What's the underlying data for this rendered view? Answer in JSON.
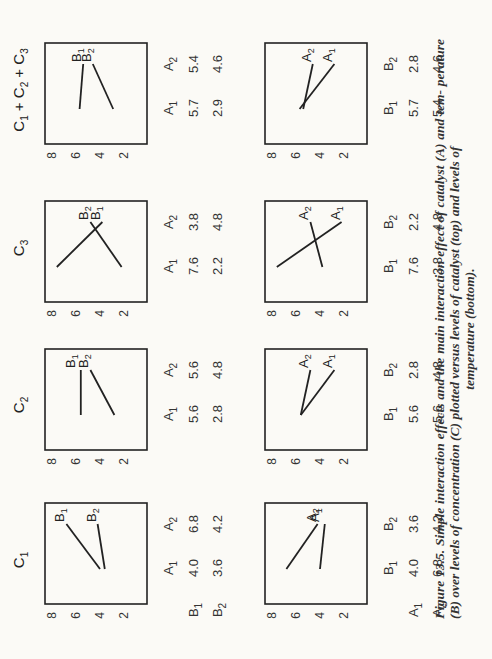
{
  "figure": {
    "caption_lines": [
      "Figure 13.5. Simple interaction effects and the main interaction effect of catalyst (A) and tem-",
      "perature (B) over levels of concentration (C) plotted versus levels of catalyst (top) and levels of",
      "temperature (bottom)."
    ],
    "orientation": "rotated 90° counter-clockwise"
  },
  "chart_data": [
    {
      "type": "line",
      "row": "top",
      "title": "C1",
      "xlabel": "",
      "ylabel": "",
      "ylim": [
        2,
        8
      ],
      "yticks": [
        8,
        6,
        4,
        2
      ],
      "categories": [
        "A1",
        "A2"
      ],
      "series": [
        {
          "name": "B1",
          "values": [
            4.0,
            6.8
          ]
        },
        {
          "name": "B2",
          "values": [
            3.6,
            4.2
          ]
        }
      ]
    },
    {
      "type": "line",
      "row": "top",
      "title": "C2",
      "ylim": [
        2,
        8
      ],
      "yticks": [
        8,
        6,
        4,
        2
      ],
      "categories": [
        "A1",
        "A2"
      ],
      "series": [
        {
          "name": "B1",
          "values": [
            5.6,
            5.6
          ]
        },
        {
          "name": "B2",
          "values": [
            2.8,
            4.8
          ]
        }
      ]
    },
    {
      "type": "line",
      "row": "top",
      "title": "C3",
      "ylim": [
        2,
        8
      ],
      "yticks": [
        8,
        6,
        4,
        2
      ],
      "categories": [
        "A1",
        "A2"
      ],
      "series": [
        {
          "name": "B1",
          "values": [
            7.6,
            3.8
          ]
        },
        {
          "name": "B2",
          "values": [
            2.2,
            4.8
          ]
        }
      ]
    },
    {
      "type": "line",
      "row": "top",
      "title": "C1 + C2 + C3",
      "ylim": [
        2,
        8
      ],
      "yticks": [
        8,
        6,
        4,
        2
      ],
      "categories": [
        "A1",
        "A2"
      ],
      "series": [
        {
          "name": "B1",
          "values": [
            5.7,
            5.4
          ]
        },
        {
          "name": "B2",
          "values": [
            2.9,
            4.6
          ]
        }
      ]
    },
    {
      "type": "line",
      "row": "bottom",
      "title": "C1",
      "ylim": [
        2,
        8
      ],
      "yticks": [
        8,
        6,
        4,
        2
      ],
      "categories": [
        "B1",
        "B2"
      ],
      "series": [
        {
          "name": "A1",
          "values": [
            4.0,
            3.6
          ]
        },
        {
          "name": "A2",
          "values": [
            6.8,
            4.2
          ]
        }
      ]
    },
    {
      "type": "line",
      "row": "bottom",
      "title": "C2",
      "ylim": [
        2,
        8
      ],
      "yticks": [
        8,
        6,
        4,
        2
      ],
      "categories": [
        "B1",
        "B2"
      ],
      "series": [
        {
          "name": "A1",
          "values": [
            5.6,
            2.8
          ]
        },
        {
          "name": "A2",
          "values": [
            5.6,
            4.8
          ]
        }
      ]
    },
    {
      "type": "line",
      "row": "bottom",
      "title": "C3",
      "ylim": [
        2,
        8
      ],
      "yticks": [
        8,
        6,
        4,
        2
      ],
      "categories": [
        "B1",
        "B2"
      ],
      "series": [
        {
          "name": "A1",
          "values": [
            7.6,
            2.2
          ]
        },
        {
          "name": "A2",
          "values": [
            3.8,
            4.8
          ]
        }
      ]
    },
    {
      "type": "line",
      "row": "bottom",
      "title": "C1 + C2 + C3",
      "ylim": [
        2,
        8
      ],
      "yticks": [
        8,
        6,
        4,
        2
      ],
      "categories": [
        "B1",
        "B2"
      ],
      "series": [
        {
          "name": "A1",
          "values": [
            5.7,
            2.8
          ]
        },
        {
          "name": "A2",
          "values": [
            5.4,
            4.6
          ]
        }
      ]
    }
  ],
  "top_row": {
    "column_titles": [
      "C1",
      "C2",
      "C3",
      "C1 + C2 + C3"
    ],
    "tables": [
      {
        "col_headers": [
          "A1",
          "A2"
        ],
        "rows": [
          {
            "label": "B1",
            "values": [
              "4.0",
              "6.8"
            ]
          },
          {
            "label": "B2",
            "values": [
              "3.6",
              "4.2"
            ]
          }
        ]
      },
      {
        "col_headers": [
          "A1",
          "A2"
        ],
        "rows": [
          {
            "label": "",
            "values": [
              "5.6",
              "5.6"
            ]
          },
          {
            "label": "",
            "values": [
              "2.8",
              "4.8"
            ]
          }
        ]
      },
      {
        "col_headers": [
          "A1",
          "A2"
        ],
        "rows": [
          {
            "label": "",
            "values": [
              "7.6",
              "3.8"
            ]
          },
          {
            "label": "",
            "values": [
              "2.2",
              "4.8"
            ]
          }
        ]
      },
      {
        "col_headers": [
          "A1",
          "A2"
        ],
        "rows": [
          {
            "label": "",
            "values": [
              "5.7",
              "5.4"
            ]
          },
          {
            "label": "",
            "values": [
              "2.9",
              "4.6"
            ]
          }
        ]
      }
    ]
  },
  "bottom_row": {
    "tables": [
      {
        "col_headers": [
          "B1",
          "B2"
        ],
        "rows": [
          {
            "label": "A1",
            "values": [
              "4.0",
              "3.6"
            ]
          },
          {
            "label": "A2",
            "values": [
              "6.8",
              "4.2"
            ]
          }
        ]
      },
      {
        "col_headers": [
          "B1",
          "B2"
        ],
        "rows": [
          {
            "label": "",
            "values": [
              "5.6",
              "2.8"
            ]
          },
          {
            "label": "",
            "values": [
              "5.6",
              "4.8"
            ]
          }
        ]
      },
      {
        "col_headers": [
          "B1",
          "B2"
        ],
        "rows": [
          {
            "label": "",
            "values": [
              "7.6",
              "2.2"
            ]
          },
          {
            "label": "",
            "values": [
              "3.8",
              "4.8"
            ]
          }
        ]
      },
      {
        "col_headers": [
          "B1",
          "B2"
        ],
        "rows": [
          {
            "label": "",
            "values": [
              "5.7",
              "2.8"
            ]
          },
          {
            "label": "",
            "values": [
              "5.4",
              "4.6"
            ]
          }
        ]
      }
    ]
  }
}
